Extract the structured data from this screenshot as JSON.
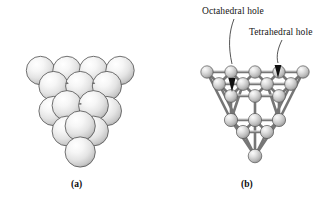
{
  "figure": {
    "type": "diagram",
    "background_color": "#ffffff",
    "panels": [
      {
        "id": "a",
        "caption": "(a)",
        "style": "space-filling close-packed spheres",
        "sphere_fill_light": "#ffffff",
        "sphere_fill_mid": "#e3e3e3",
        "sphere_fill_dark": "#9a9a9a",
        "sphere_outline": "#4a4a4a",
        "rows": [
          {
            "name": "back-row",
            "count": 4
          },
          {
            "name": "second-row",
            "count": 3
          },
          {
            "name": "third-row",
            "count": 2
          },
          {
            "name": "front-row",
            "count": 1
          }
        ],
        "total_spheres": 10
      },
      {
        "id": "b",
        "caption": "(b)",
        "style": "ball-and-stick tetrahedral cluster",
        "ball_fill_light": "#f2f2f2",
        "ball_fill_mid": "#c8c8c8",
        "ball_fill_dark": "#7e7e7e",
        "ball_outline": "#4f4f4f",
        "bond_color": "#8c8c8c",
        "bond_outline": "#5a5a5a",
        "layers": [
          {
            "name": "top-layer",
            "count": 10
          },
          {
            "name": "middle-layer",
            "count": 6
          },
          {
            "name": "lower-layer",
            "count": 3
          },
          {
            "name": "apex",
            "count": 1
          }
        ]
      }
    ],
    "annotations": [
      {
        "id": "octahedral",
        "label": "Octahedral hole",
        "leader": "curved line from label down-right to arrowhead",
        "arrow_color": "#111111"
      },
      {
        "id": "tetrahedral",
        "label": "Tetrahedral hole",
        "leader": "curved line from label down-left to arrowhead",
        "arrow_color": "#111111"
      }
    ]
  },
  "labels": {
    "octahedral_hole": "Octahedral hole",
    "tetrahedral_hole": "Tetrahedral hole"
  },
  "captions": {
    "a": "(a)",
    "b": "(b)"
  }
}
